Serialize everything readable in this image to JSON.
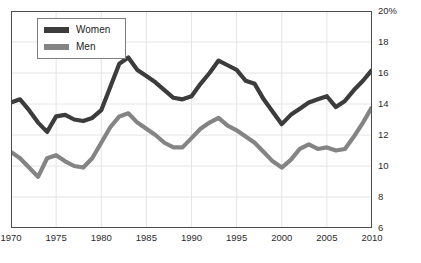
{
  "legend": {
    "position": "top-left-inside",
    "items": [
      {
        "label": "Women",
        "color": "#3c3c3c"
      },
      {
        "label": "Men",
        "color": "#848484"
      }
    ]
  },
  "axes": {
    "y_ticks": [
      "20%",
      "18",
      "16",
      "14",
      "12",
      "10",
      "8",
      "6"
    ],
    "x_ticks": [
      "1970",
      "1975",
      "1980",
      "1985",
      "1990",
      "1995",
      "2000",
      "2005",
      "2010"
    ]
  },
  "chart_data": {
    "type": "line",
    "title": "",
    "subtitle": "",
    "xlabel": "",
    "ylabel": "",
    "xlim": [
      1970,
      2010
    ],
    "ylim": [
      6,
      20
    ],
    "y_unit": "%",
    "grid": true,
    "legend_position": "top-left-inside",
    "x": [
      1970,
      1971,
      1972,
      1973,
      1974,
      1975,
      1976,
      1977,
      1978,
      1979,
      1980,
      1981,
      1982,
      1983,
      1984,
      1985,
      1986,
      1987,
      1988,
      1989,
      1990,
      1991,
      1992,
      1993,
      1994,
      1995,
      1996,
      1997,
      1998,
      1999,
      2000,
      2001,
      2002,
      2003,
      2004,
      2005,
      2006,
      2007,
      2008,
      2009,
      2010
    ],
    "series": [
      {
        "name": "Women",
        "color": "#3c3c3c",
        "values": [
          14.1,
          14.3,
          13.6,
          12.8,
          12.2,
          13.2,
          13.3,
          13.0,
          12.9,
          13.1,
          13.6,
          15.1,
          16.6,
          17.0,
          16.2,
          15.8,
          15.4,
          14.9,
          14.4,
          14.3,
          14.5,
          15.3,
          16.0,
          16.8,
          16.5,
          16.2,
          15.5,
          15.3,
          14.3,
          13.5,
          12.7,
          13.3,
          13.7,
          14.1,
          14.3,
          14.5,
          13.8,
          14.2,
          14.9,
          15.5,
          16.2
        ]
      },
      {
        "name": "Men",
        "color": "#848484",
        "values": [
          10.9,
          10.5,
          9.9,
          9.3,
          10.5,
          10.7,
          10.3,
          10.0,
          9.9,
          10.5,
          11.5,
          12.5,
          13.2,
          13.4,
          12.8,
          12.4,
          12.0,
          11.5,
          11.2,
          11.2,
          11.8,
          12.4,
          12.8,
          13.1,
          12.6,
          12.3,
          11.9,
          11.5,
          10.9,
          10.3,
          9.9,
          10.4,
          11.1,
          11.4,
          11.1,
          11.2,
          11.0,
          11.1,
          11.9,
          12.8,
          13.8
        ]
      }
    ]
  }
}
